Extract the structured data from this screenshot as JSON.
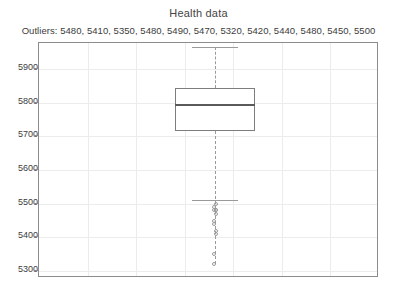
{
  "chart_data": {
    "type": "box",
    "title": "Health data",
    "subtitle": "Outliers: 5480, 5410, 5350, 5480, 5490, 5470, 5320, 5420, 5440, 5480, 5450, 5500",
    "outliers_prefix": "Outliers:",
    "xlabel": "",
    "ylabel": "",
    "ylim": [
      5300,
      5965
    ],
    "yticks": [
      5900,
      5800,
      5700,
      5600,
      5500,
      5400,
      5300
    ],
    "ytick_labels": [
      "5900",
      "5800",
      "5700",
      "5600",
      "5500",
      "5400",
      "5300"
    ],
    "grid": true,
    "legend": "none",
    "box": {
      "whisker_high": 5965,
      "q3": 5845,
      "median": 5797,
      "q1": 5715,
      "whisker_low": 5510
    },
    "outliers": [
      5480,
      5410,
      5350,
      5480,
      5490,
      5470,
      5320,
      5420,
      5440,
      5480,
      5450,
      5500
    ],
    "colors": {
      "box_edge": "#7d7d7d",
      "median": "#5a5a5a",
      "whisker": "#9a9a9a",
      "outlier": "#9a9a9a",
      "grid": "#ececec",
      "frame": "#8c8c8c",
      "text": "#3c3c3c",
      "background": "#ffffff"
    }
  }
}
